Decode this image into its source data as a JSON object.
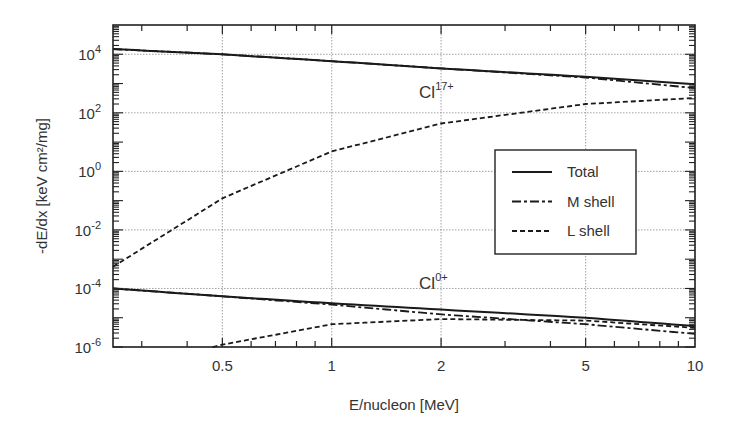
{
  "chart_data": {
    "type": "line",
    "title": "",
    "xlabel": "E/nucleon [MeV]",
    "ylabel": "-dE/dx [keV cm²/mg]",
    "xscale": "log",
    "yscale": "log",
    "xlim": [
      0.25,
      10
    ],
    "ylim": [
      1e-06,
      100000.0
    ],
    "grid": true,
    "legend_position": "inside right-center",
    "x_ticks": [
      {
        "value": 0.5,
        "label": "0.5"
      },
      {
        "value": 1,
        "label": "1"
      },
      {
        "value": 2,
        "label": "2"
      },
      {
        "value": 5,
        "label": "5"
      },
      {
        "value": 10,
        "label": "10"
      }
    ],
    "y_ticks": [
      {
        "exp": 4,
        "base": "10",
        "sup": "4"
      },
      {
        "exp": 2,
        "base": "10",
        "sup": "2"
      },
      {
        "exp": 0,
        "base": "10",
        "sup": "0"
      },
      {
        "exp": -2,
        "base": "10",
        "sup": "-2"
      },
      {
        "exp": -4,
        "base": "10",
        "sup": "-4"
      },
      {
        "exp": -6,
        "base": "10",
        "sup": "-6"
      }
    ],
    "legend": [
      {
        "label": "Total",
        "style": "solid"
      },
      {
        "label": "M shell",
        "style": "dash-dot"
      },
      {
        "label": "L shell",
        "style": "dashed"
      }
    ],
    "annotations": [
      {
        "text": "Cl",
        "sup": "17+",
        "x": 2,
        "y": 500
      },
      {
        "text": "Cl",
        "sup": "0+",
        "x": 2,
        "y": 0.00015
      }
    ],
    "x": [
      0.25,
      0.5,
      1,
      2,
      5,
      10
    ],
    "series": [
      {
        "name": "Total",
        "group": "Cl17+",
        "style": "solid",
        "values": [
          15000,
          10000,
          5800,
          3300,
          1700,
          950
        ]
      },
      {
        "name": "M shell",
        "group": "Cl17+",
        "style": "dash-dot",
        "values": [
          15000,
          10000,
          5800,
          3300,
          1600,
          700
        ]
      },
      {
        "name": "L shell",
        "group": "Cl17+",
        "style": "dashed",
        "values": [
          0.00055,
          0.12,
          4.8,
          43,
          200,
          320
        ]
      },
      {
        "name": "Total",
        "group": "Cl0+",
        "style": "solid",
        "values": [
          0.0001,
          5.4e-05,
          3.1e-05,
          1.9e-05,
          1e-05,
          5.2e-06
        ]
      },
      {
        "name": "M shell",
        "group": "Cl0+",
        "style": "dash-dot",
        "values": [
          0.0001,
          5.4e-05,
          2.8e-05,
          1.3e-05,
          6e-06,
          2.8e-06
        ]
      },
      {
        "name": "L shell",
        "group": "Cl0+",
        "style": "dashed",
        "x": [
          0.47,
          0.5,
          1,
          2,
          5,
          10
        ],
        "values": [
          1e-06,
          1.2e-06,
          6e-06,
          9e-06,
          8e-06,
          4.5e-06
        ]
      }
    ]
  }
}
